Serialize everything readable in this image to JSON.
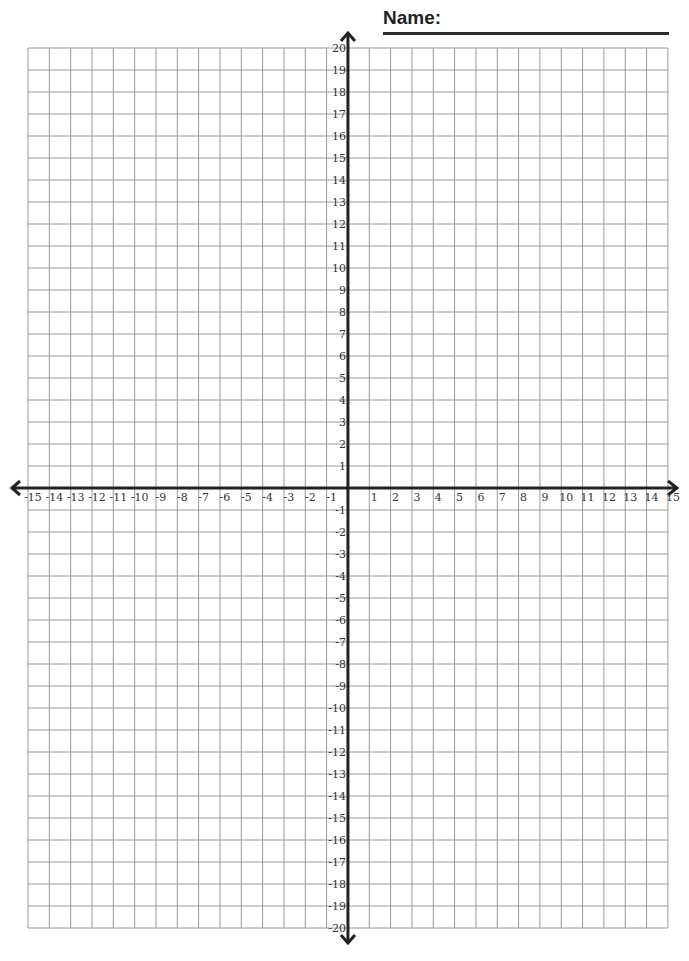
{
  "header": {
    "name_label": "Name:"
  },
  "grid": {
    "left": 28,
    "top": 48,
    "cols": 30,
    "rows": 40,
    "cell_w": 21.33,
    "cell_h": 22,
    "grid_color": "#9a9a9a",
    "axis_color": "#222222"
  },
  "axes": {
    "x_min": -15,
    "x_max": 15,
    "y_min": -20,
    "y_max": 20,
    "x_labels": [
      "-15",
      "-14",
      "-13",
      "-12",
      "-11",
      "-10",
      "-9",
      "-8",
      "-7",
      "-6",
      "-5",
      "-4",
      "-3",
      "-2",
      "-1",
      "1",
      "2",
      "3",
      "4",
      "5",
      "6",
      "7",
      "8",
      "9",
      "10",
      "11",
      "12",
      "13",
      "14",
      "15"
    ],
    "y_labels": [
      "20",
      "19",
      "18",
      "17",
      "16",
      "15",
      "14",
      "13",
      "12",
      "11",
      "10",
      "9",
      "8",
      "7",
      "6",
      "5",
      "4",
      "3",
      "2",
      "1",
      "-1",
      "-2",
      "-3",
      "-4",
      "-5",
      "-6",
      "-7",
      "-8",
      "-9",
      "-10",
      "-11",
      "-12",
      "-13",
      "-14",
      "-15",
      "-16",
      "-17",
      "-18",
      "-19",
      "-20"
    ]
  }
}
